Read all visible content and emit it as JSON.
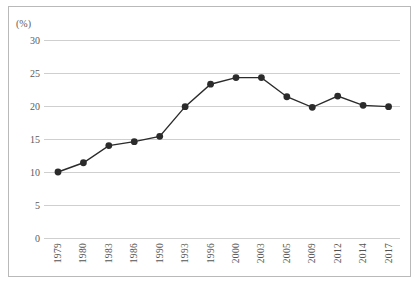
{
  "chart_data": {
    "type": "line",
    "title": "",
    "subtitle": "",
    "xlabel": "",
    "ylabel": "(%)",
    "unit_label": "(%)",
    "categories": [
      "1979",
      "1980",
      "1983",
      "1986",
      "1990",
      "1993",
      "1996",
      "2000",
      "2003",
      "2005",
      "2009",
      "2012",
      "2014",
      "2017"
    ],
    "values": [
      10.0,
      11.4,
      14.0,
      14.6,
      15.4,
      19.9,
      23.3,
      24.3,
      24.3,
      21.4,
      19.8,
      21.5,
      20.1,
      19.9
    ],
    "series": [
      {
        "name": "",
        "values": [
          10.0,
          11.4,
          14.0,
          14.6,
          15.4,
          19.9,
          23.3,
          24.3,
          24.3,
          21.4,
          19.8,
          21.5,
          20.1,
          19.9
        ]
      }
    ],
    "ylim": [
      0,
      30
    ],
    "yticks": [
      0,
      5,
      10,
      15,
      20,
      25,
      30
    ],
    "ytick_labels": [
      "0",
      "5",
      "10",
      "15",
      "20",
      "25",
      "30"
    ],
    "grid": true,
    "legend": "none",
    "marker": "circle",
    "line_color": "#2b2b2b",
    "marker_color": "#2b2b2b",
    "grid_color": "#cfcfcf",
    "axis_text_color": "#555555",
    "border_color": "#b9b9b9",
    "background": "#ffffff",
    "xlabel_rotation": 90
  }
}
